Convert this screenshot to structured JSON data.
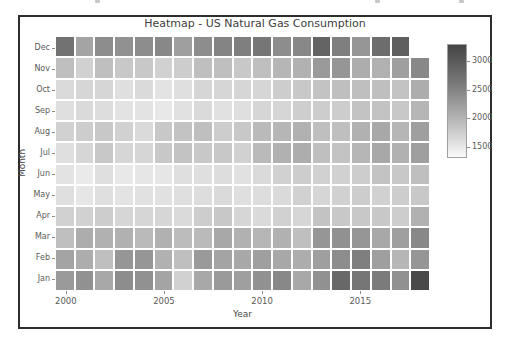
{
  "figure": {
    "title": "Heatmap - US Natural Gas Consumption",
    "xlabel": "Year",
    "ylabel": "Month"
  },
  "colors": {
    "figure_border": "#2d2d2d",
    "title_text": "#404040",
    "tick_text": "#5a5a5a",
    "heatmap_light": "#fafafa",
    "heatmap_dark": "#444444"
  },
  "chart_data": {
    "type": "heatmap",
    "title": "Heatmap - US Natural Gas Consumption",
    "xlabel": "Year",
    "ylabel": "Month",
    "years": [
      2000,
      2001,
      2002,
      2003,
      2004,
      2005,
      2006,
      2007,
      2008,
      2009,
      2010,
      2011,
      2012,
      2013,
      2014,
      2015,
      2016,
      2017,
      2018
    ],
    "months_top_to_bottom": [
      "Dec",
      "Nov",
      "Oct",
      "Sep",
      "Aug",
      "Jul",
      "Jun",
      "May",
      "Apr",
      "Mar",
      "Feb",
      "Jan"
    ],
    "x_tick_labels": [
      "2000",
      "2005",
      "2010",
      "2015"
    ],
    "x_tick_years": [
      2000,
      2005,
      2010,
      2015
    ],
    "grid": false,
    "colorbar": {
      "colormap": "Greys",
      "min": 1300,
      "max": 3300,
      "ticks_top_to_bottom": [
        3000,
        2500,
        2000,
        1500
      ],
      "light_hex": "#fafafa",
      "dark_hex": "#444444"
    },
    "missing_cells": [
      [
        "Dec",
        2018
      ]
    ],
    "values": {
      "Dec": [
        2800,
        2250,
        2500,
        2450,
        2500,
        2550,
        2300,
        2500,
        2600,
        2650,
        2750,
        2500,
        2550,
        2950,
        2650,
        2400,
        2850,
        3000,
        null
      ],
      "Nov": [
        1950,
        1750,
        1950,
        1850,
        1850,
        1750,
        1800,
        1950,
        1950,
        1850,
        1950,
        2050,
        2100,
        2350,
        2400,
        2150,
        2100,
        2300,
        2550
      ],
      "Oct": [
        1650,
        1700,
        1700,
        1600,
        1650,
        1550,
        1600,
        1700,
        1700,
        1700,
        1700,
        1800,
        1850,
        1900,
        1950,
        1950,
        1950,
        1900,
        2150
      ],
      "Sep": [
        1600,
        1650,
        1620,
        1550,
        1550,
        1500,
        1570,
        1650,
        1570,
        1600,
        1700,
        1700,
        1780,
        1800,
        1800,
        1900,
        1900,
        1850,
        2050
      ],
      "Aug": [
        1750,
        1800,
        1850,
        1750,
        1650,
        1850,
        1900,
        1950,
        1800,
        1850,
        2000,
        2050,
        2100,
        1950,
        1950,
        2100,
        2200,
        2050,
        2300
      ],
      "Jul": [
        1600,
        1700,
        1850,
        1700,
        1700,
        1850,
        1900,
        1850,
        1850,
        1750,
        2000,
        2100,
        2150,
        1950,
        1900,
        2050,
        2200,
        2100,
        2300
      ],
      "Jun": [
        1550,
        1480,
        1600,
        1500,
        1520,
        1520,
        1600,
        1600,
        1620,
        1580,
        1650,
        1750,
        1800,
        1750,
        1750,
        1800,
        1900,
        1850,
        1950
      ],
      "May": [
        1600,
        1520,
        1600,
        1550,
        1580,
        1580,
        1600,
        1620,
        1650,
        1600,
        1620,
        1650,
        1750,
        1700,
        1750,
        1800,
        1750,
        1800,
        1850
      ],
      "Apr": [
        1750,
        1750,
        1800,
        1700,
        1700,
        1700,
        1650,
        1800,
        1850,
        1700,
        1650,
        1750,
        1700,
        1900,
        1850,
        1850,
        1850,
        1800,
        2100
      ],
      "Mar": [
        1950,
        2150,
        2100,
        2100,
        2000,
        2100,
        1980,
        2000,
        2200,
        2100,
        2050,
        2100,
        1950,
        2400,
        2450,
        2400,
        2200,
        2300,
        2550
      ],
      "Feb": [
        2250,
        2150,
        1950,
        2400,
        2400,
        2100,
        1950,
        2350,
        2250,
        2200,
        2300,
        2200,
        2150,
        2300,
        2500,
        2650,
        2300,
        2050,
        2400
      ],
      "Jan": [
        2350,
        2450,
        2200,
        2500,
        2450,
        2250,
        1750,
        2200,
        2350,
        2300,
        2450,
        2550,
        2200,
        2450,
        2900,
        2750,
        2700,
        2450,
        3250
      ]
    }
  }
}
